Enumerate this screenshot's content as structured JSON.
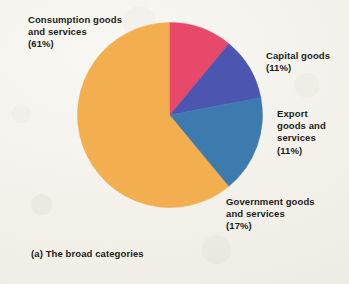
{
  "figure": {
    "caption": "(a) The broad categories",
    "background_color": "#f5f3ed",
    "text_color": "#1c1c1c"
  },
  "labels": {
    "consumption": "Consumption goods\nand services\n(61%)",
    "capital": "Capital goods\n(11%)",
    "export": "Export\ngoods and\nservices\n(11%)",
    "government": "Government goods\nand services\n(17%)"
  },
  "chart_data": {
    "type": "pie",
    "title": "(a) The broad categories",
    "xlabel": "",
    "ylabel": "",
    "legend_position": "callout-labels",
    "grid": false,
    "units": "percent",
    "start_angle_deg": 0,
    "direction": "clockwise",
    "categories": [
      "Consumption goods and services",
      "Capital goods",
      "Export goods and services",
      "Government goods and services"
    ],
    "values": [
      61,
      11,
      11,
      17
    ],
    "colors": [
      "#f2ae4f",
      "#e8486a",
      "#4c56b0",
      "#3d7baf"
    ],
    "slices": [
      {
        "label": "Consumption goods and services",
        "value": 61,
        "value_text": "(61%)",
        "color": "#f2ae4f"
      },
      {
        "label": "Capital goods",
        "value": 11,
        "value_text": "(11%)",
        "color": "#e8486a"
      },
      {
        "label": "Export goods and services",
        "value": 11,
        "value_text": "(11%)",
        "color": "#4c56b0"
      },
      {
        "label": "Government goods and services",
        "value": 17,
        "value_text": "(17%)",
        "color": "#3d7baf"
      }
    ]
  }
}
